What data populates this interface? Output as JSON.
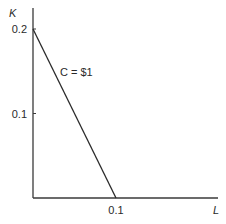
{
  "chart_data": {
    "type": "line",
    "title": "",
    "xlabel": "L",
    "ylabel": "K",
    "xlim": [
      0,
      0.2
    ],
    "ylim": [
      0,
      0.21
    ],
    "x_ticks": [
      {
        "value": 0.1,
        "label": "0.1"
      }
    ],
    "y_ticks": [
      {
        "value": 0.1,
        "label": "0.1"
      },
      {
        "value": 0.2,
        "label": "0.2"
      }
    ],
    "grid": false,
    "legend": "none",
    "series": [
      {
        "name": "C = $1",
        "points": [
          [
            0,
            0.2
          ],
          [
            0.1,
            0
          ]
        ]
      }
    ],
    "annotations": [
      {
        "text": "C = $1",
        "near": {
          "x": 0.03,
          "y": 0.145
        }
      }
    ]
  }
}
